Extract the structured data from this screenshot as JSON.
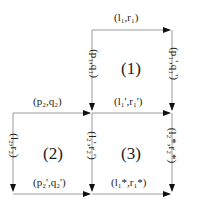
{
  "diagram": {
    "type": "commutative-squares",
    "colors": {
      "line": "#9a9a9a",
      "arrow": "#111111",
      "text": "#222222"
    },
    "squares": [
      {
        "id": "1",
        "label": "(1)",
        "top": "(l₁,r₁)",
        "bottom": "(l₁',r₁')",
        "left": "(p₁,q₁)",
        "right": "(p₁',q₁')"
      },
      {
        "id": "2",
        "label": "(2)",
        "top": "(p₂,q₂)",
        "bottom": "(p₂',q₂')",
        "left": "(l₂,r₂)",
        "right": "(l₂',r₂')"
      },
      {
        "id": "3",
        "label": "(3)",
        "top": "(l₁',r₁')",
        "bottom": "(l₁*,r₁*)",
        "left": "(l₂',r₂')",
        "right": "(l₂*,r₂*)"
      }
    ]
  }
}
